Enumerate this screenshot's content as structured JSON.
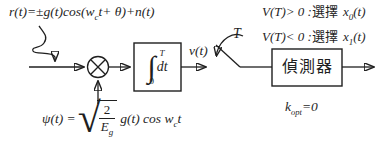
{
  "colors": {
    "ink": "#1f1f1f",
    "background": "#ffffff"
  },
  "input_formula": {
    "lhs": "r(t)=",
    "pm": "±",
    "body": "g(t)cos(w",
    "sub_c": "c",
    "mid": "t+ ",
    "theta": "θ",
    "tail": ")+n(t)"
  },
  "integrator": {
    "sign": "∫",
    "upper": "T",
    "lower": "0",
    "dt": "dt"
  },
  "v_label": "v(t)",
  "switch_label": "T",
  "conditions": {
    "line1": {
      "pre": "V(T)> 0 :",
      "choose": "選擇",
      "x": "x",
      "sub": "0",
      "tail": "(t)"
    },
    "line2": {
      "pre": "V(T)< 0 :",
      "choose": "選擇",
      "x": "x",
      "sub": "1",
      "tail": "(t)"
    }
  },
  "detector": {
    "label": "偵測器"
  },
  "kopt": {
    "base": "k",
    "sub": "opt",
    "tail": "=0"
  },
  "psi_formula": {
    "lhs": "ψ(t) =",
    "radical": "√",
    "numerator": "2",
    "den_base": "E",
    "den_sub": "g",
    "rhs": "g(t) cos w",
    "rhs_sub": "c",
    "rhs_tail": "t"
  }
}
